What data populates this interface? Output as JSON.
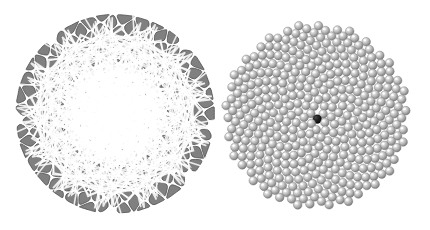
{
  "figure": {
    "title": "",
    "background_color": "#ffffff",
    "width": 430,
    "height": 230,
    "panel_count": 2
  },
  "panels": [
    {
      "name": "phyllotaxis-petal-panel",
      "label": "",
      "render_style": "voronoi-petals",
      "center_x": 115,
      "center_y": 114,
      "radius": 100,
      "fill_color": "#808080",
      "outline_color": "#4f4f4f",
      "gap_color": "#ffffff",
      "point_count": 210,
      "divergence_angle_deg": 137.507764,
      "scale_c": 7.0
    },
    {
      "name": "phyllotaxis-sphere-panel",
      "label": "",
      "render_style": "shaded-spheres",
      "center_x": 316,
      "center_y": 116,
      "radius": 92,
      "sphere_color": "#b4b4b4",
      "sphere_highlight_color": "#f2f2f2",
      "sphere_edge_color": "#6e6e6e",
      "marked_point_color": "#111111",
      "marked_point_index": 0,
      "point_count": 400,
      "divergence_angle_deg": 137.507764,
      "scale_c": 4.7,
      "sphere_radius": 4.3
    }
  ],
  "chart_data": {
    "type": "scatter",
    "title": "",
    "subtitle": "",
    "xlabel": "",
    "ylabel": "",
    "grid": false,
    "legend": null,
    "annotations": [],
    "series": [
      {
        "name": "left-petal-phyllotaxis",
        "model": "vogel",
        "divergence_angle_deg": 137.507764,
        "scale_c": 7.0,
        "n_points": 210,
        "center": [
          115,
          114
        ],
        "marker": "voronoi-cell",
        "color": "#808080"
      },
      {
        "name": "right-sphere-phyllotaxis",
        "model": "vogel",
        "divergence_angle_deg": 137.507764,
        "scale_c": 4.7,
        "n_points": 400,
        "center": [
          316,
          116
        ],
        "marker": "sphere",
        "color": "#b4b4b4",
        "highlighted_index": 0,
        "highlight_color": "#111111"
      }
    ],
    "xlim": [
      0,
      430
    ],
    "ylim": [
      0,
      230
    ]
  }
}
